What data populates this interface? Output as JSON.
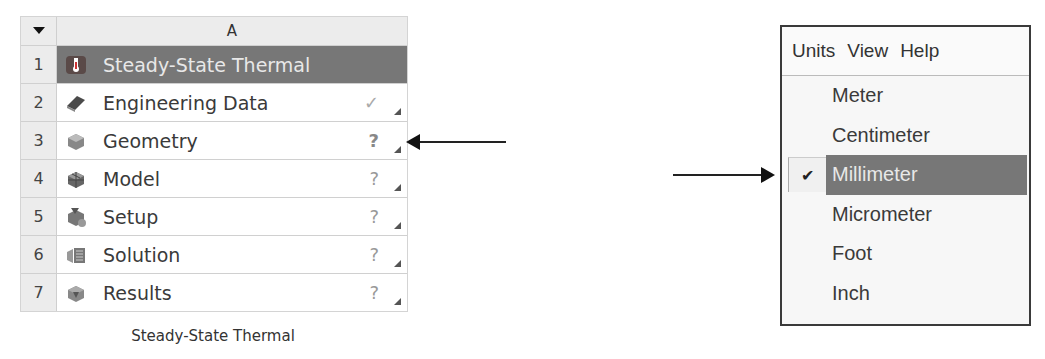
{
  "schematic": {
    "column_header": "A",
    "header_menu_icon": "dropdown-triangle-icon",
    "rows": [
      {
        "num": "1",
        "label": "Steady-State Thermal",
        "icon": "thermometer-icon",
        "status": "",
        "title": true
      },
      {
        "num": "2",
        "label": "Engineering Data",
        "icon": "engineering-data-book-icon",
        "status": "✓",
        "status_type": "check"
      },
      {
        "num": "3",
        "label": "Geometry",
        "icon": "geometry-cube-icon",
        "status": "?",
        "status_type": "question"
      },
      {
        "num": "4",
        "label": "Model",
        "icon": "model-mesh-icon",
        "status": "?",
        "status_type": "question"
      },
      {
        "num": "5",
        "label": "Setup",
        "icon": "setup-icon",
        "status": "?",
        "status_type": "question"
      },
      {
        "num": "6",
        "label": "Solution",
        "icon": "solution-icon",
        "status": "?",
        "status_type": "question"
      },
      {
        "num": "7",
        "label": "Results",
        "icon": "results-icon",
        "status": "?",
        "status_type": "question"
      }
    ],
    "caption": "Steady-State Thermal"
  },
  "menu": {
    "menubar": [
      "Units",
      "View",
      "Help"
    ],
    "items": [
      {
        "label": "Meter",
        "checked": false
      },
      {
        "label": "Centimeter",
        "checked": false
      },
      {
        "label": "Millimeter",
        "checked": true
      },
      {
        "label": "Micrometer",
        "checked": false
      },
      {
        "label": "Foot",
        "checked": false
      },
      {
        "label": "Inch",
        "checked": false
      }
    ],
    "check_glyph": "✔"
  },
  "annotations": {
    "left_arrow_target": "Geometry",
    "right_arrow_target": "Millimeter"
  },
  "colors": {
    "title_row_bg": "#777777",
    "selected_item_bg": "#777777",
    "grid_bg": "#ececec"
  }
}
